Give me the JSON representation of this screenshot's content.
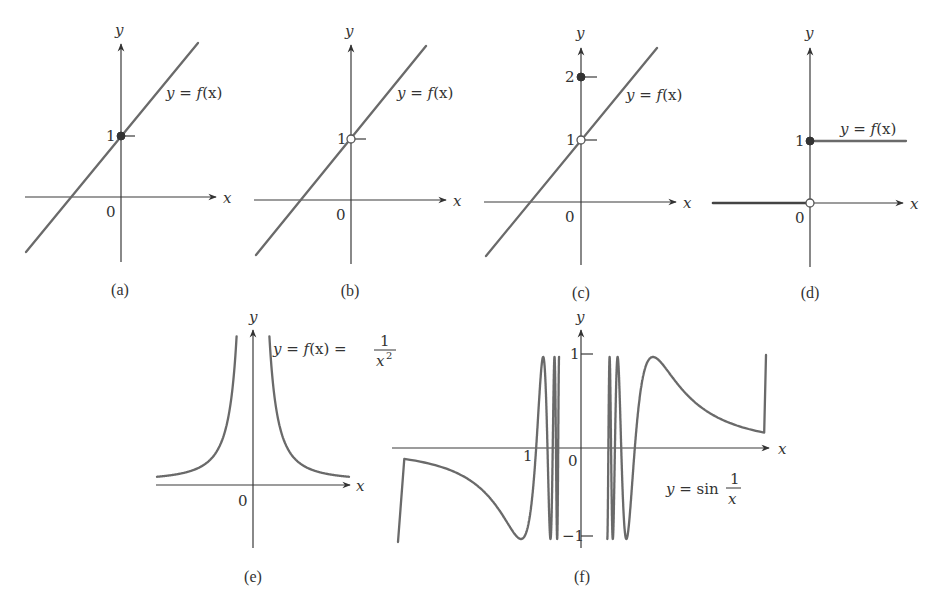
{
  "chart_data": [
    {
      "id": "a",
      "type": "line",
      "caption": "(a)",
      "function_label": "y = f(x)",
      "xlabel": "x",
      "ylabel": "y",
      "origin_label": "0",
      "y_ticks": [
        1
      ],
      "description": "Straight line through (0,1); filled point at (0,1)",
      "points": [
        {
          "x": 0,
          "y": 1,
          "style": "filled"
        }
      ]
    },
    {
      "id": "b",
      "type": "line",
      "caption": "(b)",
      "function_label": "y = f(x)",
      "xlabel": "x",
      "ylabel": "y",
      "origin_label": "0",
      "y_ticks": [
        1
      ],
      "description": "Straight line with a hole at (0,1)",
      "points": [
        {
          "x": 0,
          "y": 1,
          "style": "open"
        }
      ]
    },
    {
      "id": "c",
      "type": "line",
      "caption": "(c)",
      "function_label": "y = f(x)",
      "xlabel": "x",
      "ylabel": "y",
      "origin_label": "0",
      "y_ticks": [
        1,
        2
      ],
      "description": "Straight line with a hole at (0,1) and isolated point at (0,2)",
      "points": [
        {
          "x": 0,
          "y": 1,
          "style": "open"
        },
        {
          "x": 0,
          "y": 2,
          "style": "filled"
        }
      ]
    },
    {
      "id": "d",
      "type": "line",
      "caption": "(d)",
      "function_label": "y = f(x)",
      "xlabel": "x",
      "ylabel": "y",
      "origin_label": "0",
      "y_ticks": [
        1
      ],
      "description": "Step function: y=0 for x<0 (open at origin), y=1 for x>=0 (filled at (0,1))",
      "points": [
        {
          "x": 0,
          "y": 0,
          "style": "open"
        },
        {
          "x": 0,
          "y": 1,
          "style": "filled"
        }
      ]
    },
    {
      "id": "e",
      "type": "line",
      "caption": "(e)",
      "function_label": "y = f(x) = 1/x^2",
      "xlabel": "x",
      "ylabel": "y",
      "origin_label": "0",
      "description": "Graph of 1/x^2 with vertical asymptote at x=0"
    },
    {
      "id": "f",
      "type": "line",
      "caption": "(f)",
      "function_label": "y = sin 1/x",
      "xlabel": "x",
      "ylabel": "y",
      "origin_label": "0",
      "x_ticks": [
        1
      ],
      "y_ticks": [
        1,
        -1
      ],
      "ylim": [
        -1,
        1
      ],
      "description": "Graph of sin(1/x) oscillating between -1 and 1 near x=0"
    }
  ],
  "labels": {
    "a": {
      "y": "y",
      "x": "x",
      "zero": "0",
      "one": "1",
      "fn_y": "y",
      "fn_eq": " = ",
      "fn_f": "f",
      "fn_paren": "(x)",
      "cap": "(a)"
    },
    "b": {
      "y": "y",
      "x": "x",
      "zero": "0",
      "one": "1",
      "fn_y": "y",
      "fn_eq": " = ",
      "fn_f": "f",
      "fn_paren": "(x)",
      "cap": "(b)"
    },
    "c": {
      "y": "y",
      "x": "x",
      "zero": "0",
      "one": "1",
      "two": "2",
      "fn_y": "y",
      "fn_eq": " = ",
      "fn_f": "f",
      "fn_paren": "(x)",
      "cap": "(c)"
    },
    "d": {
      "y": "y",
      "x": "x",
      "zero": "0",
      "one": "1",
      "fn_y": "y",
      "fn_eq": " = ",
      "fn_f": "f",
      "fn_paren": "(x)",
      "cap": "(d)"
    },
    "e": {
      "y": "y",
      "x": "x",
      "zero": "0",
      "fn_y": "y",
      "fn_eq": " = ",
      "fn_f": "f",
      "fn_paren": "(x)",
      "fn_eq2": " = ",
      "num": "1",
      "den": "x",
      "exp": "2",
      "cap": "(e)"
    },
    "f": {
      "y": "y",
      "x": "x",
      "zero": "0",
      "one_x": "1",
      "one_y": "1",
      "neg_one": "−1",
      "fn_y": "y",
      "fn_eq": " = ",
      "fn_sin": "sin",
      "num": "1",
      "den": "x",
      "cap": "(f)"
    }
  },
  "colors": {
    "curve": "#6a6a6a",
    "axis": "#3a3a3a",
    "text": "#333333",
    "background": "#ffffff"
  }
}
